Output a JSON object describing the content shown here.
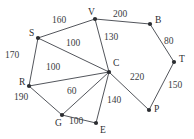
{
  "diagram": {
    "type": "weighted-undirected-graph",
    "title": "",
    "background_color": "#ffffff",
    "node_color": "#2b2d31",
    "edge_color": "#53565c",
    "label_color": "#2b2d31",
    "nodes": [
      {
        "id": "S",
        "label": "S",
        "x": 38,
        "y": 38,
        "label_x": 29,
        "label_y": 29
      },
      {
        "id": "V",
        "label": "V",
        "x": 95,
        "y": 19,
        "label_x": 88,
        "label_y": 8
      },
      {
        "id": "B",
        "label": "B",
        "x": 150,
        "y": 24,
        "label_x": 155,
        "label_y": 16
      },
      {
        "id": "T",
        "label": "T",
        "x": 174,
        "y": 62,
        "label_x": 179,
        "label_y": 55
      },
      {
        "id": "C",
        "label": "C",
        "x": 109,
        "y": 72,
        "label_x": 113,
        "label_y": 59
      },
      {
        "id": "R",
        "label": "R",
        "x": 29,
        "y": 86,
        "label_x": 19,
        "label_y": 78
      },
      {
        "id": "P",
        "label": "P",
        "x": 149,
        "y": 110,
        "label_x": 154,
        "label_y": 105
      },
      {
        "id": "G",
        "label": "G",
        "x": 62,
        "y": 115,
        "label_x": 55,
        "label_y": 119
      },
      {
        "id": "E",
        "label": "E",
        "x": 96,
        "y": 123,
        "label_x": 100,
        "label_y": 126
      }
    ],
    "edges": [
      {
        "from": "S",
        "to": "V",
        "weight": "160",
        "label_x": 52,
        "label_y": 16
      },
      {
        "from": "V",
        "to": "B",
        "weight": "200",
        "label_x": 113,
        "label_y": 10
      },
      {
        "from": "B",
        "to": "T",
        "weight": "80",
        "label_x": 164,
        "label_y": 37
      },
      {
        "from": "T",
        "to": "P",
        "weight": "150",
        "label_x": 168,
        "label_y": 81
      },
      {
        "from": "V",
        "to": "C",
        "weight": "130",
        "label_x": 104,
        "label_y": 33
      },
      {
        "from": "S",
        "to": "C",
        "weight": "100",
        "label_x": 66,
        "label_y": 39
      },
      {
        "from": "S",
        "to": "R",
        "weight": "170",
        "label_x": 5,
        "label_y": 51
      },
      {
        "from": "R",
        "to": "C",
        "weight": "100",
        "label_x": 46,
        "label_y": 63
      },
      {
        "from": "R",
        "to": "G",
        "weight": "190",
        "label_x": 14,
        "label_y": 93
      },
      {
        "from": "G",
        "to": "C",
        "weight": "60",
        "label_x": 67,
        "label_y": 87
      },
      {
        "from": "G",
        "to": "E",
        "weight": "100",
        "label_x": 69,
        "label_y": 117
      },
      {
        "from": "E",
        "to": "C",
        "weight": "140",
        "label_x": 107,
        "label_y": 96
      },
      {
        "from": "C",
        "to": "P",
        "weight": "220",
        "label_x": 130,
        "label_y": 73
      }
    ]
  }
}
